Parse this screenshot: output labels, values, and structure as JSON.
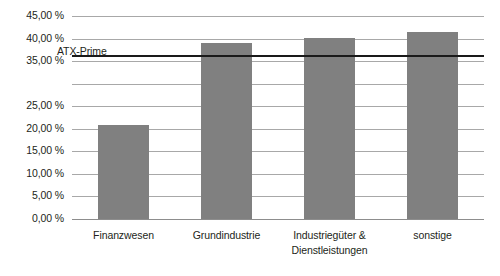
{
  "chart_data": {
    "type": "bar",
    "title": "",
    "subtitle": "",
    "xlabel": "",
    "ylabel": "",
    "ylim": [
      0,
      45
    ],
    "ytick_step": 5,
    "grid": true,
    "legend": false,
    "orientation": "vertical",
    "bar_color": "#808080",
    "gridline_color": "#a8a8a8",
    "categories": [
      "Finanzwesen",
      "Grundindustrie",
      "Industriegüter & Dienstleistungen",
      "sonstige"
    ],
    "category_lines": [
      [
        "Finanzwesen"
      ],
      [
        "Grundindustrie"
      ],
      [
        "Industriegüter &",
        "Dienstleistungen"
      ],
      [
        "sonstige"
      ]
    ],
    "values": [
      20.9,
      39.0,
      40.1,
      41.4
    ],
    "ytick_labels": [
      "45,00 %",
      "40,00 %",
      "35,00 %",
      "25,00 %",
      "20,00 %",
      "15,00 %",
      "10,00 %",
      "5,00 %",
      "0,00 %"
    ],
    "ytick_values": [
      45,
      40,
      35,
      30,
      25,
      20,
      15,
      10,
      5,
      0
    ],
    "reference_line": {
      "label": "ATX-Prime",
      "value": 36.3,
      "color": "#1a1a1a"
    }
  }
}
